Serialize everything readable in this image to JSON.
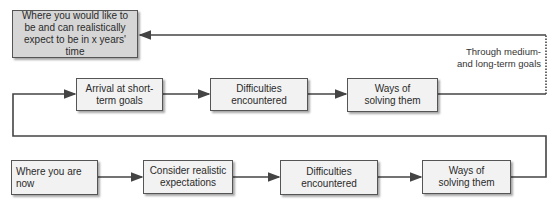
{
  "diagram": {
    "goal_box": "Where you would like to be and can realistically expect to be in x years' time",
    "top_row": [
      {
        "label": "Arrival at short-term goals"
      },
      {
        "label": "Difficulties encountered"
      },
      {
        "label": "Ways of solving them"
      }
    ],
    "bottom_row": [
      {
        "label": "Where you are now"
      },
      {
        "label": "Consider realistic expectations"
      },
      {
        "label": "Difficulties encountered"
      },
      {
        "label": "Ways of solving them"
      }
    ],
    "loop_annotation": "Through medium- and long-term goals",
    "colors": {
      "line": "#444444",
      "goal_fill": "#d6d6d6",
      "box_fill": "#f2f2f2"
    }
  }
}
